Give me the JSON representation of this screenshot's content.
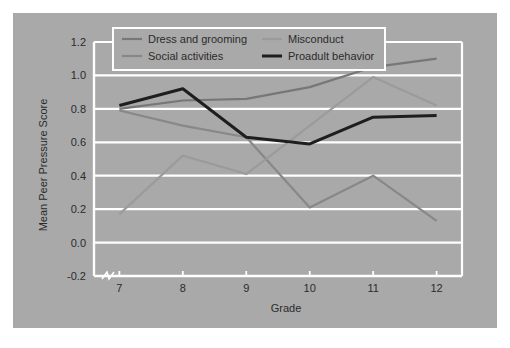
{
  "figure": {
    "panel_color": "#a9a9a9",
    "page_background": "#ffffff",
    "gridline_color": "#ffffff",
    "axis_color": "#ffffff",
    "text_color": "#2b2b2b"
  },
  "chart_data": {
    "type": "line",
    "title": "",
    "xlabel": "Grade",
    "ylabel": "Mean Peer Pressure  Score",
    "x": [
      7,
      8,
      9,
      10,
      11,
      12
    ],
    "xtick_labels": [
      "7",
      "8",
      "9",
      "10",
      "11",
      "12"
    ],
    "xlim": [
      6.6,
      12.4
    ],
    "ylim": [
      -0.2,
      1.2
    ],
    "ytick_labels": [
      "1.2",
      "1.0",
      "0.8",
      "0.6",
      "0.4",
      "0.2",
      "0.0",
      "-0.2"
    ],
    "yticks": [
      1.2,
      1.0,
      0.8,
      0.6,
      0.4,
      0.2,
      0.0,
      -0.2
    ],
    "grid": true,
    "grid_axis": "y",
    "axis_break": true,
    "legend_position": "top-center",
    "series": [
      {
        "name": "Dress and grooming",
        "color": "#777777",
        "width": 2.2,
        "values": [
          0.8,
          0.85,
          0.86,
          0.93,
          1.05,
          1.1
        ]
      },
      {
        "name": "Social activities",
        "color": "#888888",
        "width": 2.2,
        "values": [
          0.79,
          0.7,
          0.63,
          0.21,
          0.4,
          0.13
        ]
      },
      {
        "name": "Misconduct",
        "color": "#9b9b9b",
        "width": 2.2,
        "values": [
          0.17,
          0.52,
          0.41,
          0.7,
          0.99,
          0.82
        ]
      },
      {
        "name": "Proadult behavior",
        "color": "#1e1e1e",
        "width": 3.0,
        "values": [
          0.82,
          0.92,
          0.63,
          0.59,
          0.75,
          0.76
        ]
      }
    ]
  },
  "legend": {
    "entries": [
      {
        "label": "Dress and grooming",
        "color": "#777777"
      },
      {
        "label": "Misconduct",
        "color": "#9b9b9b"
      },
      {
        "label": "Social activities",
        "color": "#888888"
      },
      {
        "label": "Proadult behavior",
        "color": "#1e1e1e"
      }
    ]
  }
}
